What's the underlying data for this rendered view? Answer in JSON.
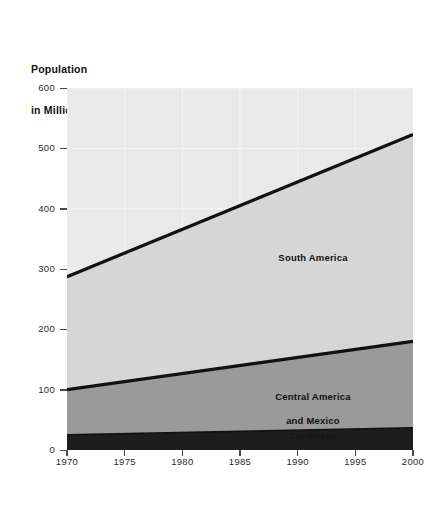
{
  "title": {
    "line1": "Population",
    "line2": "in Millions"
  },
  "chart_data": {
    "type": "area",
    "stacked": true,
    "title": "Population in Millions",
    "xlabel": "",
    "ylabel": "Population in Millions",
    "xlim": [
      1970,
      2000
    ],
    "ylim": [
      0,
      600
    ],
    "grid": true,
    "legend_position": "in-plot-annotations",
    "x": [
      1970,
      2000
    ],
    "xticks": [
      "1970",
      "1975",
      "1980",
      "1985",
      "1990",
      "1995",
      "2000"
    ],
    "xtick_values": [
      1970,
      1975,
      1980,
      1985,
      1990,
      1995,
      2000
    ],
    "yticks": [
      "0",
      "100",
      "200",
      "300",
      "400",
      "500",
      "600"
    ],
    "ytick_values": [
      0,
      100,
      200,
      300,
      400,
      500,
      600
    ],
    "series": [
      {
        "name": "Caribbean",
        "values": [
          25,
          37
        ],
        "color": "#1d1d1d"
      },
      {
        "name": "Central America and Mexico",
        "values": [
          75,
          143
        ],
        "cumulative_top": [
          100,
          180
        ],
        "color": "#9a9a9a"
      },
      {
        "name": "South America",
        "values": [
          187,
          343
        ],
        "cumulative_top": [
          287,
          523
        ],
        "color": "#d6d6d6"
      }
    ],
    "annotations": [
      {
        "text": "South America",
        "x": 1987,
        "y": 330
      },
      {
        "text": "Central America\nand Mexico",
        "x": 1987,
        "y": 125
      },
      {
        "text": "Caribbean",
        "x": 1988,
        "y": 18
      }
    ],
    "colors": {
      "plot_background_top": "#e9e9e9",
      "south_america_fill": "#d6d6d6",
      "central_america_fill": "#9a9a9a",
      "caribbean_fill": "#1d1d1d",
      "boundary_line": "#111111",
      "gridline": "#f4f4f4",
      "axis": "#4a4a4a",
      "page_background": "#ffffff"
    }
  },
  "labels": {
    "south_america": "South America",
    "central_america_line1": "Central America",
    "central_america_line2": "and Mexico",
    "caribbean": "Caribbean"
  }
}
